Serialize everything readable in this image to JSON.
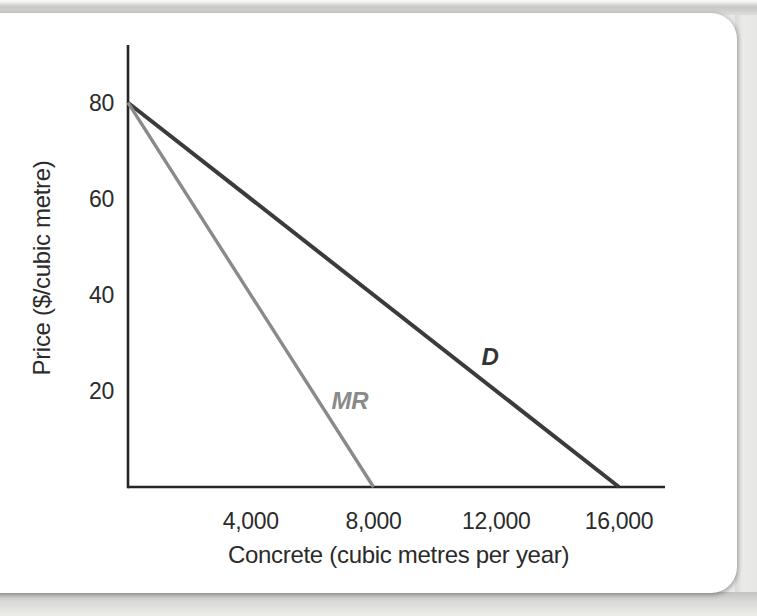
{
  "figure": {
    "card_background": "#ffffff",
    "page_background": "#e9e9e7"
  },
  "chart_data": {
    "type": "line",
    "title": "",
    "xlabel": "Concrete (cubic metres per year)",
    "ylabel": "Price ($/cubic metre)",
    "xlim": [
      0,
      17500
    ],
    "ylim": [
      0,
      92
    ],
    "grid": false,
    "legend": "inline-labels",
    "axis_color": "#262626",
    "text_color": "#2b2b2b",
    "xticks": [
      4000,
      8000,
      12000,
      16000
    ],
    "xtick_labels": [
      "4,000",
      "8,000",
      "12,000",
      "16,000"
    ],
    "yticks": [
      20,
      40,
      60,
      80
    ],
    "ytick_labels": [
      "20",
      "40",
      "60",
      "80"
    ],
    "series": [
      {
        "name": "demand",
        "label": "D",
        "color": "#3b3b3b",
        "label_color": "#333333",
        "points": [
          [
            0,
            80
          ],
          [
            16000,
            0
          ]
        ],
        "label_at": [
          11800,
          27
        ]
      },
      {
        "name": "marginal-revenue",
        "label": "MR",
        "color": "#8a8a8a",
        "label_color": "#8a8a8a",
        "points": [
          [
            0,
            80
          ],
          [
            8000,
            0
          ]
        ],
        "label_at": [
          7230,
          18
        ]
      }
    ]
  }
}
